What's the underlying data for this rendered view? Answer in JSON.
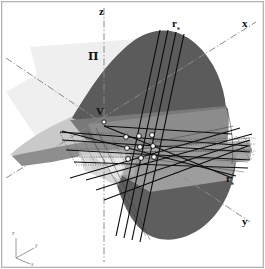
{
  "figure": {
    "background_color": "#ffffff",
    "frame_color": "#b4b4b4"
  },
  "axes": {
    "z_label": "z",
    "x_label": "x",
    "y_label": "y",
    "style": "dash-dot",
    "color": "#8a8a8a"
  },
  "plane": {
    "label": "Π",
    "fill_color": "#ececec"
  },
  "vertex": {
    "label": "V",
    "marker_color": "#ffffff"
  },
  "rulings": {
    "upper_label": "r",
    "upper_sub": "s",
    "lower_label": "r",
    "lower_sub": "s",
    "color": "#0d0d0d"
  },
  "surface": {
    "dark_band": "#5c5c5c",
    "mid_band": "#7d7d7d",
    "light_band": "#9a9a9a",
    "pale_band": "#b9b9b9"
  },
  "grid_points": {
    "count": "9",
    "rows": "3",
    "cols": "3",
    "fill": "#ffffff",
    "stroke": "#000000"
  },
  "triad": {
    "z": "z",
    "y": "y",
    "x": "x",
    "color": "#8c8c8c"
  }
}
